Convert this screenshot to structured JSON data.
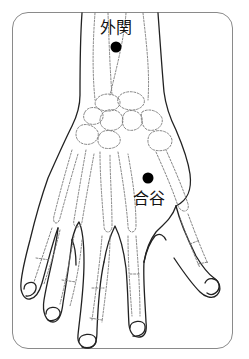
{
  "diagram": {
    "points": [
      {
        "name": "外関",
        "cx": 116,
        "cy": 47,
        "r": 5.5
      },
      {
        "name": "合谷",
        "cx": 148,
        "cy": 178,
        "r": 5.5
      }
    ],
    "colors": {
      "outline": "#222222",
      "bone": "#777777",
      "point": "#000000",
      "frame": "#8a8a8a",
      "background": "#ffffff"
    }
  },
  "labels": {
    "waiguan": "外関",
    "hegu": "合谷"
  }
}
